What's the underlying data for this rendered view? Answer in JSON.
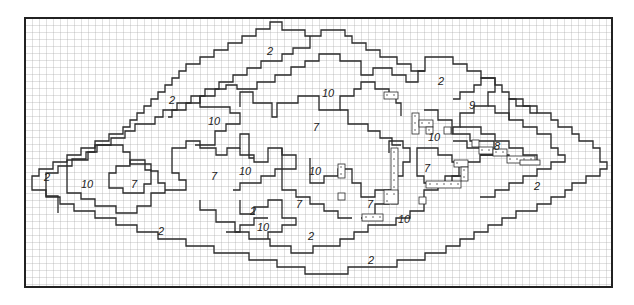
{
  "diagram": {
    "type": "grid-contour-map",
    "frame": {
      "x": 25,
      "y": 18,
      "width": 587,
      "height": 269
    },
    "cell_size": 7,
    "colors": {
      "grid": "#9a9a9a",
      "contour": "#2a2a2a",
      "frame": "#222222",
      "dots": "#555555",
      "background": "#ffffff"
    },
    "labels": [
      {
        "text": "2",
        "x": 270,
        "y": 55
      },
      {
        "text": "2",
        "x": 172,
        "y": 104
      },
      {
        "text": "2",
        "x": 47,
        "y": 181
      },
      {
        "text": "2",
        "x": 161,
        "y": 235
      },
      {
        "text": "2",
        "x": 441,
        "y": 85
      },
      {
        "text": "2",
        "x": 537,
        "y": 190
      },
      {
        "text": "2",
        "x": 253,
        "y": 215
      },
      {
        "text": "2",
        "x": 311,
        "y": 240
      },
      {
        "text": "2",
        "x": 371,
        "y": 264
      },
      {
        "text": "10",
        "x": 214,
        "y": 125
      },
      {
        "text": "10",
        "x": 328,
        "y": 97
      },
      {
        "text": "10",
        "x": 87,
        "y": 188
      },
      {
        "text": "10",
        "x": 245,
        "y": 175
      },
      {
        "text": "10",
        "x": 315,
        "y": 175
      },
      {
        "text": "10",
        "x": 263,
        "y": 231
      },
      {
        "text": "10",
        "x": 434,
        "y": 141
      },
      {
        "text": "10",
        "x": 404,
        "y": 223
      },
      {
        "text": "7",
        "x": 316,
        "y": 131
      },
      {
        "text": "7",
        "x": 134,
        "y": 188
      },
      {
        "text": "7",
        "x": 214,
        "y": 180
      },
      {
        "text": "7",
        "x": 299,
        "y": 208
      },
      {
        "text": "7",
        "x": 370,
        "y": 208
      },
      {
        "text": "7",
        "x": 427,
        "y": 172
      },
      {
        "text": "9",
        "x": 472,
        "y": 109
      },
      {
        "text": "8",
        "x": 497,
        "y": 150
      }
    ]
  }
}
